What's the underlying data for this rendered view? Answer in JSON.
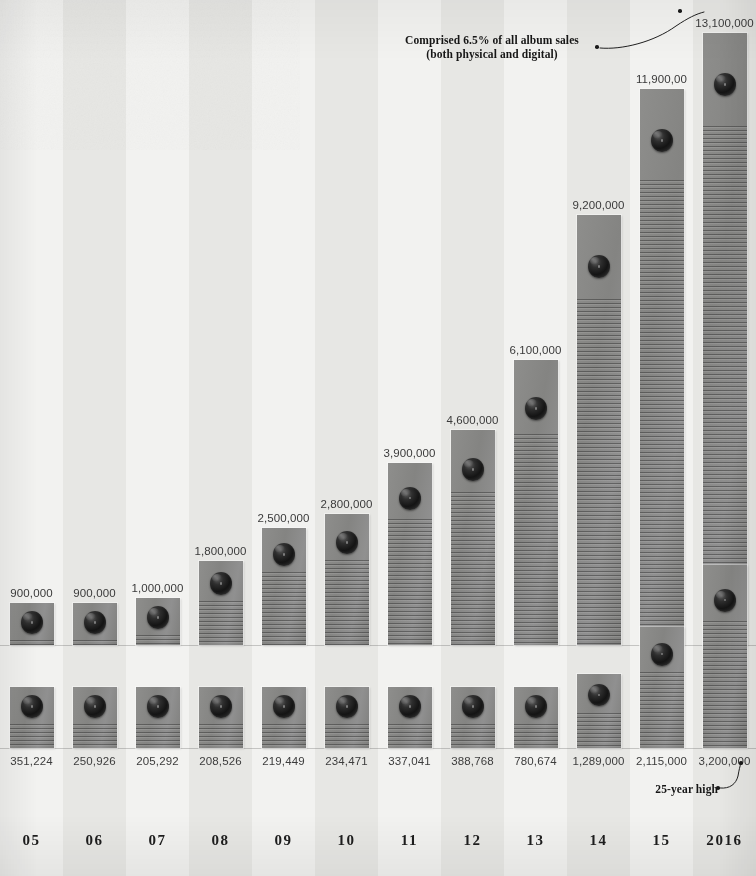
{
  "chart_data": {
    "type": "bar",
    "title": "",
    "subtitle": "",
    "xlabel": "",
    "ylabel": "",
    "grid": false,
    "legend_position": "none",
    "categories": [
      "05",
      "06",
      "07",
      "08",
      "09",
      "10",
      "11",
      "12",
      "13",
      "14",
      "15",
      "2016"
    ],
    "series": [
      {
        "name": "upper",
        "labels": [
          "900,000",
          "900,000",
          "1,000,000",
          "1,800,000",
          "2,500,000",
          "2,800,000",
          "3,900,000",
          "4,600,000",
          "6,100,000",
          "9,200,000",
          "11,900,00",
          "13,100,000"
        ],
        "values": [
          900000,
          900000,
          1000000,
          1800000,
          2500000,
          2800000,
          3900000,
          4600000,
          6100000,
          9200000,
          11900000,
          13100000
        ]
      },
      {
        "name": "lower",
        "labels": [
          "351,224",
          "250,926",
          "205,292",
          "208,526",
          "219,449",
          "234,471",
          "337,041",
          "388,768",
          "780,674",
          "1,289,000",
          "2,115,000",
          "3,200,000"
        ],
        "values": [
          351224,
          250926,
          205292,
          208526,
          219449,
          234471,
          337041,
          388768,
          780674,
          1289000,
          2115000,
          3200000
        ]
      }
    ],
    "annotations": [
      {
        "name": "top-callout",
        "line1": "Comprised 6.5% of all album sales",
        "line2": "(both physical and digital)",
        "points_to": "13,100,000"
      },
      {
        "name": "bottom-callout",
        "line1": "25-year high",
        "points_to": "3,200,000"
      }
    ]
  },
  "colors": {
    "background": "#efefed",
    "band_light": "#f2f2f0",
    "band_dark": "#e7e7e4",
    "bar_fill": "#8a8a88",
    "groove": "#232323",
    "disc": "#141414",
    "text": "#1d1d1d",
    "value_text": "#3a3a3a"
  },
  "annotations": {
    "top": {
      "line1": "Comprised 6.5% of all album sales",
      "line2": "(both physical and digital)"
    },
    "bottom": {
      "line1": "25-year high"
    }
  }
}
